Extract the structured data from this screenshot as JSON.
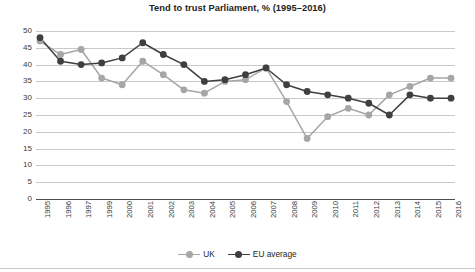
{
  "chart_data": {
    "type": "line",
    "title": "Tend to trust Parliament, % (1995–2016)",
    "xlabel": "",
    "ylabel": "",
    "ylim": [
      0,
      50
    ],
    "yticks": [
      0,
      5,
      10,
      15,
      20,
      25,
      30,
      35,
      40,
      45,
      50
    ],
    "grid": true,
    "legend_position": "bottom-center",
    "categories": [
      "1995",
      "1996",
      "1997",
      "1999",
      "2000",
      "2001",
      "2002",
      "2003",
      "2004",
      "2005",
      "2006",
      "2007",
      "2008",
      "2009",
      "2010",
      "2011",
      "2012",
      "2013",
      "2014",
      "2015",
      "2016"
    ],
    "series": [
      {
        "name": "UK",
        "color": "#a6a6a6",
        "values": [
          47,
          43,
          44.5,
          36,
          34,
          41,
          37,
          32.5,
          31.5,
          35,
          35.5,
          39,
          29,
          18,
          24.5,
          27,
          25,
          31,
          33.5,
          36,
          36
        ]
      },
      {
        "name": "EU average",
        "color": "#3f3f3f",
        "values": [
          48,
          41,
          40,
          40.5,
          42,
          46.5,
          43,
          40,
          35,
          35.5,
          37,
          39,
          34,
          32,
          31,
          30,
          28.5,
          25,
          31,
          30,
          30
        ]
      }
    ]
  },
  "legend": {
    "items": [
      {
        "label": "UK"
      },
      {
        "label": "EU average"
      }
    ]
  },
  "colors": {
    "uk": "#a6a6a6",
    "eu": "#3f3f3f",
    "gridline": "#c9c9c9",
    "axis": "#4d4d4d",
    "text": "#231f20"
  }
}
